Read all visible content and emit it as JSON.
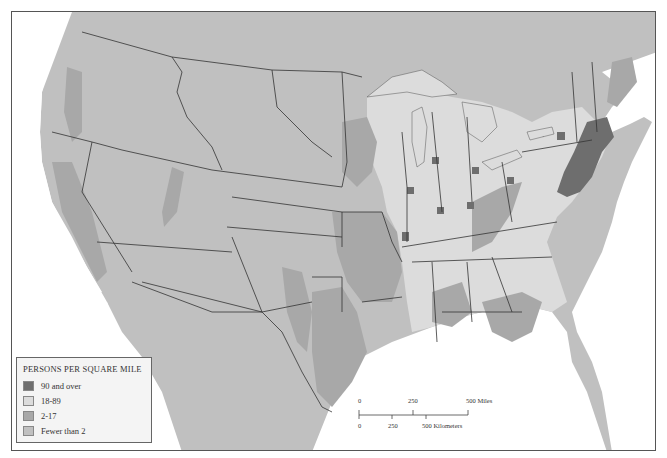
{
  "map": {
    "subject": "Population density of the United States",
    "colors": {
      "water": "#ffffff",
      "fewer_than_2": "#c0c0c0",
      "2_17": "#a8a8a8",
      "18_89": "#dcdcdc",
      "90_and_over": "#6e6e6e",
      "border": "#333333"
    }
  },
  "legend": {
    "title": "PERSONS PER SQUARE MILE",
    "items": [
      {
        "label": "90 and over",
        "color": "#6e6e6e"
      },
      {
        "label": "18-89",
        "color": "#dcdcdc"
      },
      {
        "label": "2-17",
        "color": "#a8a8a8"
      },
      {
        "label": "Fewer than 2",
        "color": "#c0c0c0"
      }
    ]
  },
  "scale_bar": {
    "miles_labels": [
      "0",
      "250",
      "500 Miles"
    ],
    "km_labels": [
      "0",
      "250",
      "500 Kilometers"
    ]
  }
}
